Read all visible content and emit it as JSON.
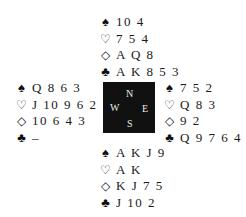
{
  "suits": {
    "spades": "♠",
    "hearts": "♡",
    "diamonds": "◇",
    "clubs": "♣"
  },
  "compass": {
    "north": "N",
    "south": "S",
    "west": "W",
    "east": "E"
  },
  "hands": {
    "north": {
      "spades": "10 4",
      "hearts": "7 5 4",
      "diamonds": "A Q 8",
      "clubs": "A K 8 5 3"
    },
    "west": {
      "spades": "Q 8 6 3",
      "hearts": "J 10 9 6 2",
      "diamonds": "10 6 4 3",
      "clubs": "–"
    },
    "east": {
      "spades": "7 5 2",
      "hearts": "Q 8 3",
      "diamonds": "9 2",
      "clubs": "Q 9 7 6 4"
    },
    "south": {
      "spades": "A K J 9",
      "hearts": "A K",
      "diamonds": "K J 7 5",
      "clubs": "J 10 2"
    }
  }
}
